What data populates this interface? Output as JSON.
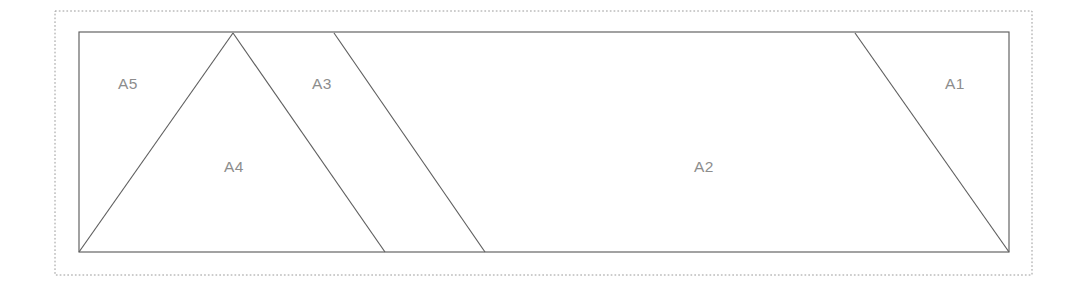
{
  "figure": {
    "background_color": "#ffffff",
    "line_color": "#5e5e5e",
    "label_color": "#8d8d8d",
    "frame_color": "#9a9a9a",
    "canvas": {
      "width": 1080,
      "height": 287
    },
    "outer_frame": {
      "name": "dotted-bounding-box",
      "style": "dotted",
      "x": 55,
      "y": 11,
      "width": 977,
      "height": 264
    },
    "main_rectangle": {
      "name": "outer-rectangle",
      "x": 79,
      "y": 32,
      "width": 930,
      "height": 220
    },
    "dividers": [
      {
        "name": "a5-a4-edge",
        "x1": 79,
        "y1": 252,
        "x2": 233,
        "y2": 33
      },
      {
        "name": "a4-a3-edge",
        "x1": 233,
        "y1": 33,
        "x2": 385,
        "y2": 252
      },
      {
        "name": "a3-a2-edge",
        "x1": 334,
        "y1": 33,
        "x2": 485,
        "y2": 252
      },
      {
        "name": "a2-a1-edge",
        "x1": 855,
        "y1": 33,
        "x2": 1009,
        "y2": 252
      }
    ],
    "regions": [
      {
        "name": "region-a1",
        "label": "A1",
        "label_x": 955,
        "label_y": 85
      },
      {
        "name": "region-a2",
        "label": "A2",
        "label_x": 704,
        "label_y": 168
      },
      {
        "name": "region-a3",
        "label": "A3",
        "label_x": 322,
        "label_y": 85
      },
      {
        "name": "region-a4",
        "label": "A4",
        "label_x": 234,
        "label_y": 168
      },
      {
        "name": "region-a5",
        "label": "A5",
        "label_x": 128,
        "label_y": 85
      }
    ]
  },
  "chart_data": {
    "type": "diagram",
    "region_labels": [
      "A1",
      "A2",
      "A3",
      "A4",
      "A5"
    ],
    "region_count": 5,
    "divider_count": 4,
    "vertices": {
      "rect_top_left": [
        79,
        32
      ],
      "rect_top_right": [
        1009,
        32
      ],
      "rect_bottom_right": [
        1009,
        252
      ],
      "rect_bottom_left": [
        79,
        252
      ],
      "a4_apex_top": [
        233,
        33
      ],
      "a4_base_right": [
        385,
        252
      ],
      "a3_top_right": [
        334,
        33
      ],
      "a3_base_right": [
        485,
        252
      ],
      "a1_top_left": [
        855,
        33
      ]
    },
    "polygons": [
      {
        "label": "A5",
        "points": [
          [
            79,
            32
          ],
          [
            233,
            32
          ],
          [
            79,
            252
          ]
        ]
      },
      {
        "label": "A4",
        "points": [
          [
            233,
            32
          ],
          [
            385,
            252
          ],
          [
            79,
            252
          ]
        ]
      },
      {
        "label": "A3",
        "points": [
          [
            233,
            32
          ],
          [
            334,
            32
          ],
          [
            485,
            252
          ],
          [
            385,
            252
          ]
        ]
      },
      {
        "label": "A2",
        "points": [
          [
            334,
            32
          ],
          [
            855,
            32
          ],
          [
            1009,
            252
          ],
          [
            485,
            252
          ]
        ]
      },
      {
        "label": "A1",
        "points": [
          [
            855,
            32
          ],
          [
            1009,
            32
          ],
          [
            1009,
            252
          ]
        ]
      }
    ]
  }
}
